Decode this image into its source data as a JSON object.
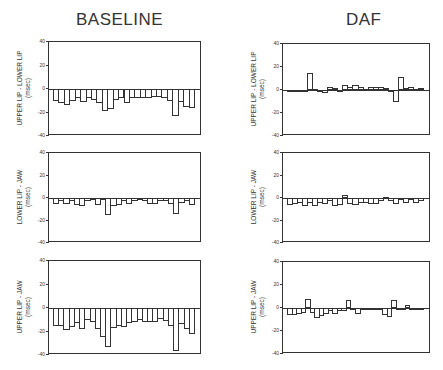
{
  "titles": {
    "left": "BASELINE",
    "right": "DAF"
  },
  "chart_data": [
    {
      "type": "bar",
      "panel": "baseline-upper-lip-lower-lip",
      "title": "BASELINE",
      "ylabel": "UPPER LIP - LOWER LIP (msec)",
      "ylim": [
        -40,
        40
      ],
      "yticks": [
        40,
        20,
        0,
        -20,
        -40
      ],
      "values": [
        -10,
        -12,
        -14,
        -10,
        -8,
        -11,
        -8,
        -9,
        -12,
        -19,
        -17,
        -9,
        -8,
        -12,
        -8,
        -8,
        -8,
        -8,
        -7,
        -7,
        -8,
        -10,
        -23,
        -11,
        -15,
        -16
      ]
    },
    {
      "type": "bar",
      "panel": "baseline-lower-lip-jaw",
      "title": "BASELINE",
      "ylabel": "LOWER LIP - JAW (msec)",
      "ylim": [
        -40,
        40
      ],
      "yticks": [
        40,
        20,
        0,
        -20,
        -40
      ],
      "values": [
        -5,
        -3,
        -5,
        -3,
        -6,
        -7,
        -3,
        -2,
        -6,
        -1,
        -15,
        -7,
        -6,
        -3,
        -5,
        -3,
        -1,
        -3,
        -5,
        -5,
        -3,
        -3,
        -5,
        -14,
        -4,
        -3,
        -6
      ]
    },
    {
      "type": "bar",
      "panel": "baseline-upper-lip-jaw",
      "title": "BASELINE",
      "ylabel": "UPPER LIP - JAW (msec)",
      "ylim": [
        -40,
        40
      ],
      "yticks": [
        40,
        20,
        0,
        -20,
        -40
      ],
      "values": [
        -15,
        -15,
        -19,
        -16,
        -13,
        -18,
        -10,
        -12,
        -18,
        -25,
        -33,
        -17,
        -15,
        -16,
        -13,
        -12,
        -10,
        -12,
        -12,
        -12,
        -9,
        -11,
        -15,
        -37,
        -14,
        -18,
        -22
      ]
    },
    {
      "type": "bar",
      "panel": "daf-upper-lip-lower-lip",
      "title": "DAF",
      "ylabel": "UPPER LIP - LOWER LIP (msec)",
      "ylim": [
        -40,
        40
      ],
      "yticks": [
        40,
        20,
        0,
        -20,
        -40
      ],
      "values": [
        -1,
        -1,
        -1,
        -1,
        15,
        0,
        -1,
        -3,
        3,
        2,
        -1,
        4,
        3,
        4,
        3,
        1,
        3,
        3,
        3,
        2,
        -2,
        -10,
        11,
        2,
        3,
        1,
        2
      ]
    },
    {
      "type": "bar",
      "panel": "daf-lower-lip-jaw",
      "title": "DAF",
      "ylabel": "LOWER LIP - JAW (msec)",
      "ylim": [
        -40,
        40
      ],
      "yticks": [
        40,
        20,
        0,
        -20,
        -40
      ],
      "values": [
        -6,
        -5,
        -4,
        -7,
        -4,
        -7,
        -4,
        -5,
        -3,
        -7,
        -6,
        3,
        -5,
        -6,
        -4,
        -4,
        -5,
        -5,
        -3,
        1,
        -3,
        -5,
        -2,
        -4,
        -2,
        -4,
        -3
      ]
    },
    {
      "type": "bar",
      "panel": "daf-upper-lip-jaw",
      "title": "DAF",
      "ylabel": "UPPER LIP - JAW (msec)",
      "ylim": [
        -40,
        40
      ],
      "yticks": [
        40,
        20,
        0,
        -20,
        -40
      ],
      "values": [
        -6,
        -6,
        -5,
        -4,
        8,
        -4,
        -9,
        -7,
        -5,
        -3,
        -5,
        -3,
        -3,
        7,
        -1,
        -5,
        -1,
        -1,
        -1,
        -2,
        -2,
        -6,
        -8,
        7,
        -1,
        -2,
        3,
        -2,
        -1,
        -1
      ]
    }
  ],
  "tick_labels": [
    "40",
    "20",
    "0",
    "-20",
    "-40"
  ]
}
